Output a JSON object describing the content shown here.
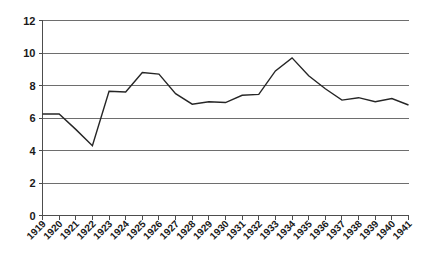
{
  "chart_data": {
    "type": "line",
    "title": "",
    "subtitle": "",
    "xlabel": "",
    "ylabel": "",
    "grid": true,
    "legend": "none",
    "ylim": [
      0,
      12
    ],
    "ytick_labels": [
      "12",
      "10",
      "8",
      "6",
      "4",
      "2",
      "0"
    ],
    "ytick_values": [
      12,
      10,
      8,
      6,
      4,
      2,
      0
    ],
    "categories": [
      "1919",
      "1920",
      "1921",
      "1922",
      "1923",
      "1924",
      "1925",
      "1926",
      "1927",
      "1928",
      "1929",
      "1930",
      "1931",
      "1932",
      "1933",
      "1934",
      "1935",
      "1936",
      "1937",
      "1938",
      "1939",
      "1940",
      "1941"
    ],
    "values": [
      6.25,
      6.25,
      5.3,
      4.3,
      7.65,
      7.6,
      8.8,
      8.7,
      7.5,
      6.85,
      7.0,
      6.95,
      7.4,
      7.45,
      8.9,
      9.7,
      8.6,
      7.8,
      7.1,
      7.25,
      7.0,
      7.2,
      6.8
    ],
    "series": [
      {
        "name": "series-1",
        "values": [
          6.25,
          6.25,
          5.3,
          4.3,
          7.65,
          7.6,
          8.8,
          8.7,
          7.5,
          6.85,
          7.0,
          6.95,
          7.4,
          7.45,
          8.9,
          9.7,
          8.6,
          7.8,
          7.1,
          7.25,
          7.0,
          7.2,
          6.8
        ],
        "color": "#262626"
      }
    ]
  },
  "colors": {
    "line": "#262626",
    "grid": "#6e6e6e",
    "axis": "#4d4d4d",
    "text": "#1a1a1a",
    "background": "#ffffff"
  }
}
